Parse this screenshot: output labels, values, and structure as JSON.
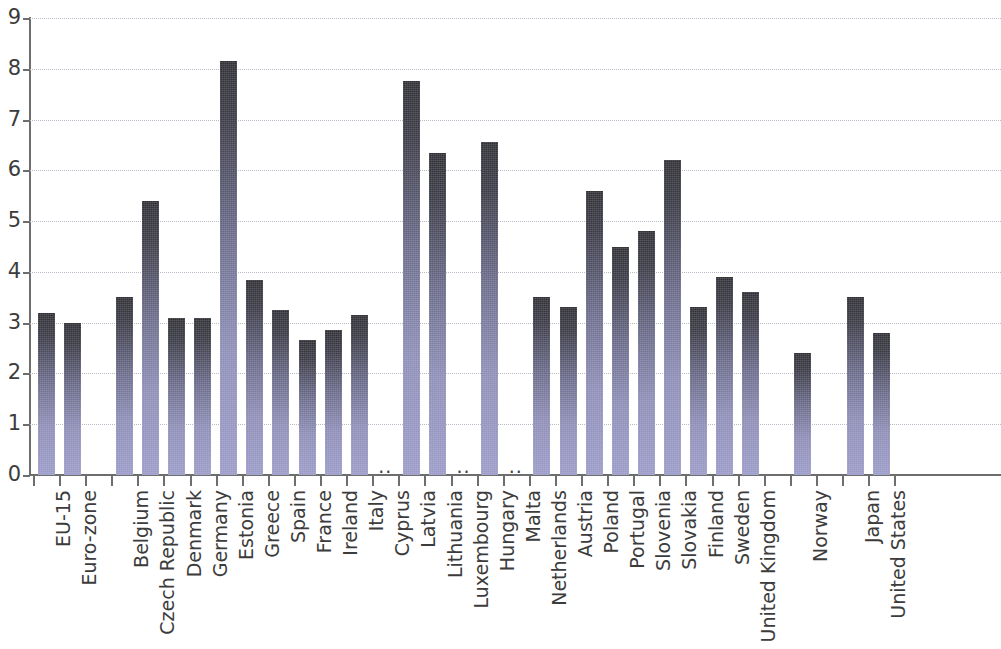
{
  "chart_data": {
    "type": "bar",
    "title": "",
    "subtitle": "",
    "xlabel": "",
    "ylabel": "",
    "ylim": [
      0,
      9
    ],
    "ytick_labels": [
      "0",
      "1",
      "2",
      "3",
      "4",
      "5",
      "6",
      "7",
      "8",
      "9"
    ],
    "ytick_values": [
      0,
      1,
      2,
      3,
      4,
      5,
      6,
      7,
      8,
      9
    ],
    "grid": true,
    "gridlines_axis": "y",
    "legend": null,
    "missing_value_marker": "..",
    "bar_gradient": {
      "top_color": "#2f2f35",
      "bottom_color": "#9a9ac8"
    },
    "axis_color": "#6e6e6e",
    "grid_color": "#b9b9c8",
    "text_color": "#3c3c3c",
    "categories": [
      "EU-15",
      "Euro-zone",
      "",
      "Belgium",
      "Czech Republic",
      "Denmark",
      "Germany",
      "Estonia",
      "Greece",
      "Spain",
      "France",
      "Ireland",
      "Italy",
      "Cyprus",
      "Latvia",
      "Lithuania",
      "Luxembourg",
      "Hungary",
      "Malta",
      "Netherlands",
      "Austria",
      "Poland",
      "Portugal",
      "Slovenia",
      "Slovakia",
      "Finland",
      "Sweden",
      "United Kingdom",
      "",
      "Norway",
      "",
      "Japan",
      "United States"
    ],
    "values": [
      3.2,
      3.0,
      null,
      3.5,
      5.4,
      3.1,
      3.1,
      8.15,
      3.85,
      3.25,
      2.65,
      2.85,
      3.15,
      null,
      7.75,
      6.35,
      null,
      6.55,
      null,
      3.5,
      3.3,
      5.6,
      4.5,
      4.8,
      6.2,
      3.3,
      3.9,
      3.6,
      null,
      2.4,
      null,
      3.5,
      2.8
    ]
  }
}
